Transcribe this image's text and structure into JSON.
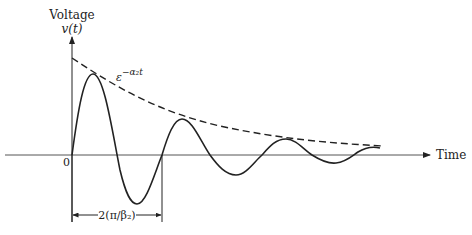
{
  "diagram": {
    "type": "damped-oscillation",
    "y_axis": {
      "label": "Voltage",
      "sublabel": "v(t)"
    },
    "x_axis": {
      "label": "Time"
    },
    "origin_label": "0",
    "envelope_label": {
      "base": "ε",
      "exponent": "−α₂t"
    },
    "period_label": "2(π/β₂)",
    "colors": {
      "ink": "#222222",
      "axis": "#555555"
    }
  }
}
